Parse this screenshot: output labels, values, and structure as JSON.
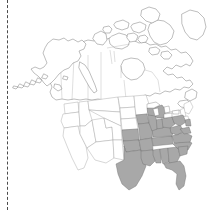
{
  "figure": {
    "type": "species-distribution-map",
    "region": "North America",
    "title": "",
    "background_color": "#ffffff",
    "width": 214,
    "height": 210
  },
  "legend": {
    "shaded_label": "present",
    "unshaded_label": "absent"
  },
  "style": {
    "shaded_fill": "#a8a8a8",
    "unshaded_fill": "#ffffff",
    "country_outline": "#6e6e6e",
    "state_outline": "#9a9a9a",
    "shaded_state_outline": "#6b6b6b",
    "rule_color": "#4a4a4a"
  },
  "rule": {
    "name": "left-dashed-rule",
    "orientation": "vertical",
    "x": 7,
    "dash_pattern": "2,2"
  },
  "landmasses": [
    {
      "id": "alaska",
      "label": "Alaska",
      "shaded": false
    },
    {
      "id": "canada",
      "label": "Canada",
      "shaded": false
    },
    {
      "id": "arctic-islands",
      "label": "Canadian Arctic Archipelago",
      "shaded": false
    },
    {
      "id": "greenland-edge",
      "label": "Greenland",
      "shaded": false
    },
    {
      "id": "conus",
      "label": "Contiguous United States",
      "shaded": "partial"
    }
  ],
  "shaded_regions": [
    {
      "id": "southeast-us",
      "label": "Southeastern United States",
      "fill": "#a8a8a8"
    }
  ],
  "shaded_states": [
    "Texas (east)",
    "Oklahoma (east)",
    "Kansas (southeast)",
    "Missouri",
    "Arkansas",
    "Louisiana",
    "Mississippi",
    "Alabama",
    "Georgia",
    "Florida",
    "South Carolina",
    "North Carolina",
    "Tennessee",
    "Kentucky",
    "Virginia",
    "West Virginia",
    "Maryland",
    "Delaware",
    "Ohio",
    "Indiana",
    "Illinois",
    "Iowa (southeast)",
    "Michigan (south)",
    "Pennsylvania (south)",
    "New Jersey",
    "Wisconsin (south)"
  ],
  "unshaded_states": [
    "Washington",
    "Oregon",
    "California",
    "Idaho",
    "Nevada",
    "Utah",
    "Arizona",
    "Montana",
    "Wyoming",
    "Colorado",
    "New Mexico",
    "North Dakota",
    "South Dakota",
    "Nebraska",
    "Minnesota",
    "Maine",
    "New Hampshire",
    "Vermont",
    "New York",
    "Massachusetts",
    "Connecticut",
    "Rhode Island"
  ]
}
